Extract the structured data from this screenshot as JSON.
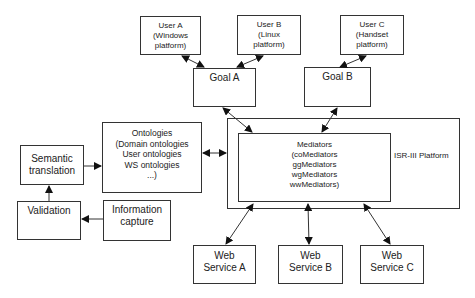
{
  "diagram": {
    "users": [
      {
        "id": "user-a",
        "lines": [
          "User A",
          "(Windows",
          "platform)"
        ]
      },
      {
        "id": "user-b",
        "lines": [
          "User B",
          "(Linux",
          "platform)"
        ]
      },
      {
        "id": "user-c",
        "lines": [
          "User C",
          "(Handset",
          "platform)"
        ]
      }
    ],
    "goals": [
      {
        "id": "goal-a",
        "label": "Goal A"
      },
      {
        "id": "goal-b",
        "label": "Goal B"
      }
    ],
    "ontologies": {
      "lines": [
        "Ontologies",
        "(Domain ontologies",
        "User ontologies",
        "WS ontologies",
        "...)"
      ]
    },
    "semantic_translation": {
      "lines": [
        "Semantic",
        "translation"
      ]
    },
    "validation": {
      "label": "Validation"
    },
    "information_capture": {
      "lines": [
        "Information",
        "capture"
      ]
    },
    "platform": {
      "label": "ISR-III Platform"
    },
    "mediators": {
      "lines": [
        "Mediators",
        "(coMediators",
        "ggMediators",
        "wgMediators",
        "wwMediators)"
      ]
    },
    "web_services": [
      {
        "id": "ws-a",
        "lines": [
          "Web",
          "Service A"
        ]
      },
      {
        "id": "ws-b",
        "lines": [
          "Web",
          "Service B"
        ]
      },
      {
        "id": "ws-c",
        "lines": [
          "Web",
          "Service C"
        ]
      }
    ],
    "edges": [
      {
        "from": "User A",
        "to": "Goal A",
        "type": "bidirectional"
      },
      {
        "from": "User B",
        "to": "Goal A",
        "type": "bidirectional"
      },
      {
        "from": "User C",
        "to": "Goal B",
        "type": "bidirectional"
      },
      {
        "from": "Goal A",
        "to": "Mediators",
        "type": "bidirectional"
      },
      {
        "from": "Goal B",
        "to": "Mediators",
        "type": "bidirectional"
      },
      {
        "from": "Ontologies",
        "to": "ISR-III Platform",
        "type": "bidirectional"
      },
      {
        "from": "Semantic translation",
        "to": "Ontologies",
        "type": "directed"
      },
      {
        "from": "Validation",
        "to": "Semantic translation",
        "type": "directed"
      },
      {
        "from": "Information capture",
        "to": "Validation",
        "type": "directed"
      },
      {
        "from": "Mediators",
        "to": "Web Service A",
        "type": "bidirectional"
      },
      {
        "from": "Mediators",
        "to": "Web Service B",
        "type": "bidirectional"
      },
      {
        "from": "Mediators",
        "to": "Web Service C",
        "type": "bidirectional"
      }
    ]
  }
}
